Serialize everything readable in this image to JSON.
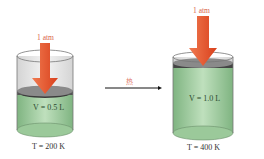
{
  "left": {
    "pressure": "1 atm",
    "volume": "V = 0.5 L",
    "temperature": "T = 200 K"
  },
  "right": {
    "pressure": "1 atm",
    "volume": "V = 1.0 L",
    "temperature": "T = 400 K"
  },
  "process_label": "热",
  "colors": {
    "arrow": "#e8552f",
    "gas": "#a9d3a8",
    "piston": "#4a4a4a",
    "label": "#d9634a"
  }
}
